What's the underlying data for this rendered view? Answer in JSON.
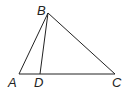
{
  "diagram": {
    "type": "geometry-triangle",
    "points": {
      "A": {
        "label": "A",
        "x": 19,
        "y": 74
      },
      "B": {
        "label": "B",
        "x": 48,
        "y": 13
      },
      "C": {
        "label": "C",
        "x": 115,
        "y": 74
      },
      "D": {
        "label": "D",
        "x": 40,
        "y": 74
      }
    },
    "segments": [
      "AB",
      "BC",
      "AC",
      "BD"
    ],
    "colors": {
      "stroke": "#222222",
      "background": "#ffffff"
    }
  }
}
